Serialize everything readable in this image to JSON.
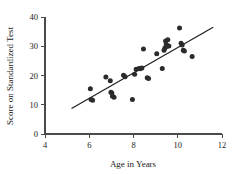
{
  "chart_data": {
    "type": "scatter",
    "title": "",
    "xlabel": "Age in Years",
    "ylabel": "Score on Standardized Test",
    "xlim": [
      4,
      12
    ],
    "ylim": [
      0,
      40
    ],
    "xticks": [
      4,
      6,
      8,
      10,
      12
    ],
    "yticks": [
      0,
      10,
      20,
      30,
      40
    ],
    "xtick_labels": [
      "4",
      "6",
      "8",
      "10",
      "12"
    ],
    "ytick_labels": [
      "0",
      "10",
      "20",
      "30",
      "40"
    ],
    "grid": false,
    "legend": null,
    "marker_color": "#2b2b2b",
    "line_color": "#1a1a1a",
    "axis_color": "#4a4a4a",
    "points": [
      [
        6.05,
        15.5
      ],
      [
        6.08,
        11.8
      ],
      [
        6.15,
        11.5
      ],
      [
        6.75,
        19.5
      ],
      [
        6.95,
        18.2
      ],
      [
        6.98,
        14.3
      ],
      [
        7.02,
        14.0
      ],
      [
        7.05,
        12.9
      ],
      [
        7.12,
        12.6
      ],
      [
        7.55,
        20.1
      ],
      [
        7.62,
        19.6
      ],
      [
        7.95,
        11.8
      ],
      [
        8.05,
        20.4
      ],
      [
        8.12,
        22.1
      ],
      [
        8.25,
        22.4
      ],
      [
        8.3,
        22.3
      ],
      [
        8.38,
        22.6
      ],
      [
        8.45,
        29.1
      ],
      [
        8.62,
        19.2
      ],
      [
        8.68,
        19.0
      ],
      [
        9.05,
        27.4
      ],
      [
        9.3,
        22.4
      ],
      [
        9.38,
        28.6
      ],
      [
        9.42,
        29.4
      ],
      [
        9.45,
        31.8
      ],
      [
        9.48,
        30.6
      ],
      [
        9.5,
        29.9
      ],
      [
        9.55,
        32.2
      ],
      [
        9.6,
        30.1
      ],
      [
        10.08,
        36.2
      ],
      [
        10.15,
        31.0
      ],
      [
        10.2,
        30.4
      ],
      [
        10.25,
        28.6
      ],
      [
        10.3,
        28.4
      ],
      [
        10.65,
        26.5
      ]
    ],
    "fit_line": {
      "x_start": 5.2,
      "y_start": 8.7,
      "x_end": 11.6,
      "y_end": 36.5
    }
  }
}
